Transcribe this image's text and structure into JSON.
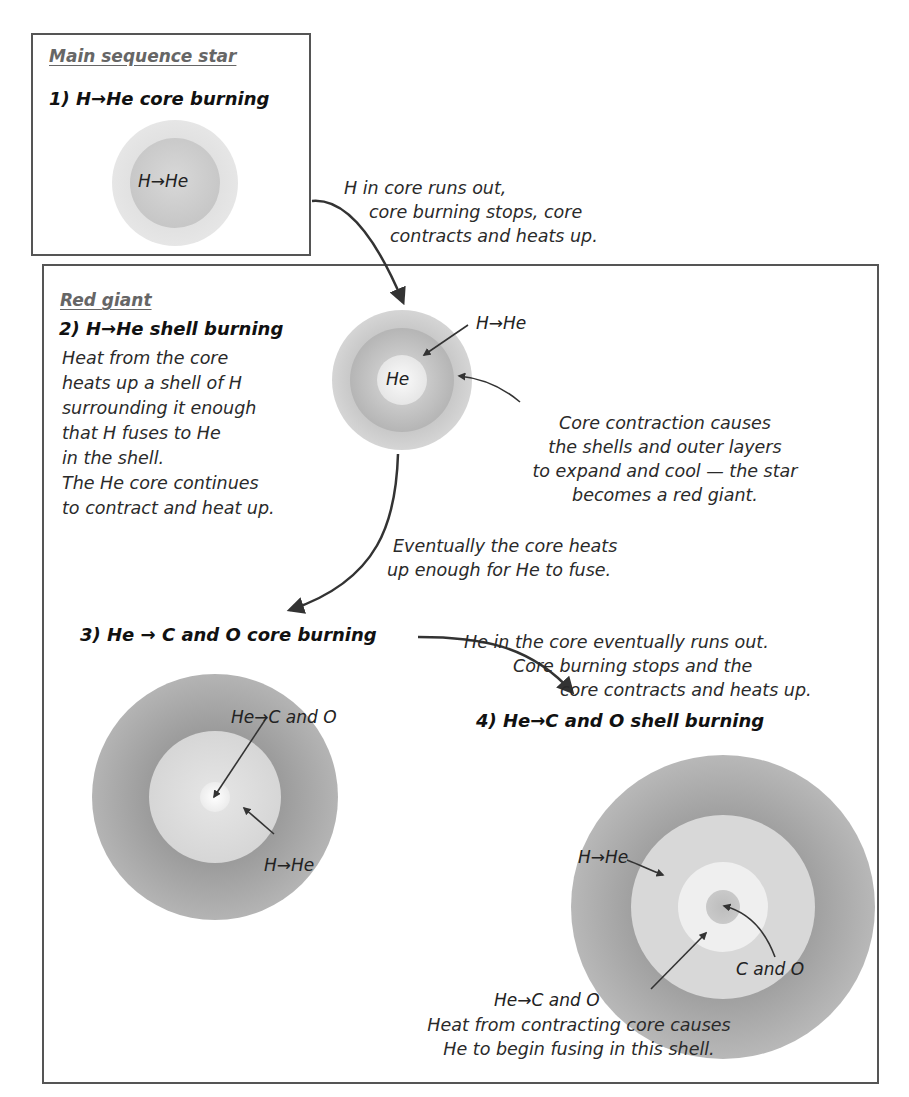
{
  "panels": {
    "main_sequence": {
      "title": "Main sequence star",
      "step": "1) H→He core burning",
      "star_label": "H→He"
    },
    "red_giant": {
      "title": "Red giant",
      "step2": {
        "title": "2) H→He shell burning",
        "description": [
          "Heat from the core",
          "heats up a shell of H",
          "surrounding it enough",
          "that H fuses to He",
          "in the shell.",
          "The He core continues",
          "to contract and heat up."
        ],
        "core_label": "He",
        "shell_label": "H→He",
        "expansion_note": [
          "Core contraction causes",
          "the shells and outer layers",
          "to expand and cool — the star",
          "becomes a red giant."
        ]
      },
      "transition_2_3": [
        "Eventually the core heats",
        "up enough for He to fuse."
      ],
      "step3": {
        "title": "3) He → C and O core burning",
        "core_label": "He→C and O",
        "shell_label": "H→He"
      },
      "transition_3_4": [
        "He in the core eventually runs out.",
        "Core burning stops and the",
        "core contracts and heats up."
      ],
      "step4": {
        "title": "4) He→C and O shell burning",
        "outer_shell_label": "H→He",
        "core_label": "C and O",
        "inner_shell_label": "He→C and O",
        "note": [
          "Heat from contracting core causes",
          "He to begin fusing in this shell."
        ]
      }
    }
  },
  "transition_1_2": [
    "H in core runs out,",
    "core burning stops, core",
    "contracts and heats up."
  ],
  "colors": {
    "border": "#555555",
    "outer_layer": "#a9a9a9",
    "light_layer": "#d9d9d9",
    "core_white": "#f2f2f2",
    "header_text": "#666666",
    "arrow": "#333333"
  }
}
